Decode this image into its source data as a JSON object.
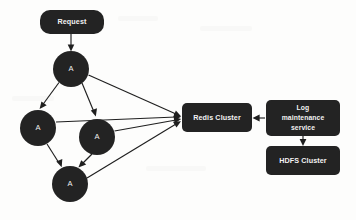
{
  "diagram": {
    "background_color": "#fdfdfc",
    "node_fill_color": "#232323",
    "node_text_color": "#f2f2f2",
    "edge_color": "#1f1f1f",
    "nodes": [
      {
        "id": "request",
        "shape": "rounded-rect",
        "label": "Request",
        "x": 40,
        "y": 10,
        "w": 64,
        "h": 24
      },
      {
        "id": "app-a-1",
        "shape": "circle",
        "label": "A",
        "cx": 71,
        "cy": 69,
        "r": 18
      },
      {
        "id": "app-a-2",
        "shape": "circle",
        "label": "A",
        "cx": 38,
        "cy": 128,
        "r": 18
      },
      {
        "id": "app-a-3",
        "shape": "circle",
        "label": "A",
        "cx": 97,
        "cy": 137,
        "r": 18
      },
      {
        "id": "app-a-4",
        "shape": "circle",
        "label": "A",
        "cx": 70,
        "cy": 184,
        "r": 18
      },
      {
        "id": "redis",
        "shape": "rounded-rect",
        "label": "Redis Cluster",
        "x": 182,
        "y": 103,
        "w": 70,
        "h": 29
      },
      {
        "id": "log-svc",
        "shape": "rounded-rect",
        "label": "Log maintenance service",
        "x": 266,
        "y": 100,
        "w": 74,
        "h": 36,
        "label_lines": [
          "Log",
          "maintenance",
          "service"
        ]
      },
      {
        "id": "hdfs",
        "shape": "rounded-rect",
        "label": "HDFS Cluster",
        "x": 266,
        "y": 146,
        "w": 74,
        "h": 29
      }
    ],
    "edges": [
      {
        "from": "request",
        "to": "app-a-1",
        "arrow": true
      },
      {
        "from": "app-a-1",
        "to": "app-a-2",
        "arrow": true
      },
      {
        "from": "app-a-1",
        "to": "app-a-3",
        "arrow": true
      },
      {
        "from": "app-a-1",
        "to": "redis",
        "arrow": true
      },
      {
        "from": "app-a-2",
        "to": "app-a-4",
        "arrow": true
      },
      {
        "from": "app-a-2",
        "to": "redis",
        "arrow": true
      },
      {
        "from": "app-a-3",
        "to": "app-a-4",
        "arrow": true
      },
      {
        "from": "app-a-3",
        "to": "redis",
        "arrow": true
      },
      {
        "from": "app-a-4",
        "to": "redis",
        "arrow": true
      },
      {
        "from": "log-svc",
        "to": "redis",
        "arrow": true
      },
      {
        "from": "log-svc",
        "to": "hdfs",
        "arrow": true
      }
    ]
  }
}
